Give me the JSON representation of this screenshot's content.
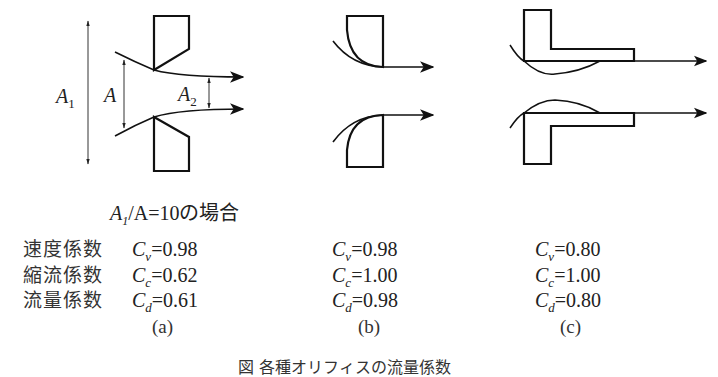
{
  "figure": {
    "caption": "図 各種オリフィスの流量係数",
    "condition": {
      "prefix": "A",
      "prefix_sub": "1",
      "rest": "/A=10の場合"
    },
    "dimension_labels": {
      "a1": {
        "main": "A",
        "sub": "1"
      },
      "a": {
        "main": "A"
      },
      "a2": {
        "main": "A",
        "sub": "2"
      }
    },
    "row_labels": [
      "速度係数",
      "縮流係数",
      "流量係数"
    ],
    "columns": [
      {
        "id": "a",
        "label": "(a)",
        "coefficients": [
          {
            "symbol": "C",
            "sub": "v",
            "value": "=0.98"
          },
          {
            "symbol": "C",
            "sub": "c",
            "value": "=0.62"
          },
          {
            "symbol": "C",
            "sub": "d",
            "value": "=0.61"
          }
        ]
      },
      {
        "id": "b",
        "label": "(b)",
        "coefficients": [
          {
            "symbol": "C",
            "sub": "v",
            "value": "=0.98"
          },
          {
            "symbol": "C",
            "sub": "c",
            "value": "=1.00"
          },
          {
            "symbol": "C",
            "sub": "d",
            "value": "=0.98"
          }
        ]
      },
      {
        "id": "c",
        "label": "(c)",
        "coefficients": [
          {
            "symbol": "C",
            "sub": "v",
            "value": "=0.80"
          },
          {
            "symbol": "C",
            "sub": "c",
            "value": "=1.00"
          },
          {
            "symbol": "C",
            "sub": "d",
            "value": "=0.80"
          }
        ]
      }
    ],
    "colors": {
      "stroke": "#111111",
      "thin": "#333333"
    }
  }
}
